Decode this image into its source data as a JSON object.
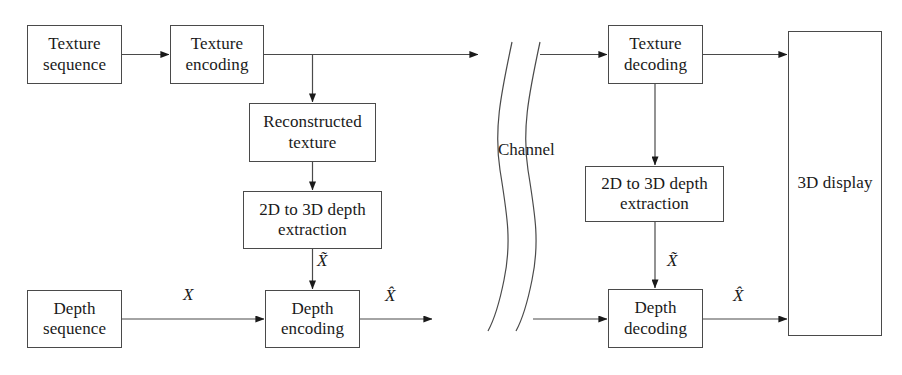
{
  "diagram": {
    "background_color": "#ffffff",
    "line_color": "#4a4a4a",
    "text_color": "#1a1a1a",
    "nodes": [
      {
        "id": "texture-sequence",
        "label": "Texture\nsequence",
        "x": 27,
        "y": 25,
        "w": 95,
        "h": 59
      },
      {
        "id": "texture-encoding",
        "label": "Texture\nencoding",
        "x": 170,
        "y": 25,
        "w": 94,
        "h": 59
      },
      {
        "id": "reconstructed-texture",
        "label": "Reconstructed\ntexture",
        "x": 249,
        "y": 103,
        "w": 127,
        "h": 59
      },
      {
        "id": "depth-extraction-left",
        "label": "2D to 3D depth\nextraction",
        "x": 243,
        "y": 191,
        "w": 139,
        "h": 58
      },
      {
        "id": "depth-sequence",
        "label": "Depth\nsequence",
        "x": 27,
        "y": 290,
        "w": 95,
        "h": 58
      },
      {
        "id": "depth-encoding",
        "label": "Depth\nencoding",
        "x": 265,
        "y": 290,
        "w": 95,
        "h": 58
      },
      {
        "id": "texture-decoding",
        "label": "Texture\ndecoding",
        "x": 608,
        "y": 25,
        "w": 95,
        "h": 59
      },
      {
        "id": "depth-extraction-right",
        "label": "2D to 3D depth\nextraction",
        "x": 585,
        "y": 166,
        "w": 139,
        "h": 56
      },
      {
        "id": "depth-decoding",
        "label": "Depth\ndecoding",
        "x": 608,
        "y": 289,
        "w": 95,
        "h": 59
      },
      {
        "id": "display-3d",
        "label": "3D display",
        "x": 788,
        "y": 31,
        "w": 94,
        "h": 305
      }
    ],
    "channel": {
      "label": "Channel",
      "label_x": 498,
      "label_y": 140
    },
    "edge_labels": [
      {
        "id": "x-plain-left",
        "text": "X",
        "x": 183,
        "y": 285
      },
      {
        "id": "x-tilde-left",
        "text": "X̃",
        "x": 317,
        "y": 251
      },
      {
        "id": "x-hat-left",
        "text": "X̂",
        "x": 385,
        "y": 286
      },
      {
        "id": "x-tilde-right",
        "text": "X̃",
        "x": 667,
        "y": 251
      },
      {
        "id": "x-hat-right",
        "text": "X̂",
        "x": 733,
        "y": 286
      }
    ],
    "connectors": [
      {
        "id": "texture-seq-to-enc",
        "from": "texture-sequence",
        "to": "texture-encoding"
      },
      {
        "id": "texture-enc-to-channel",
        "from": "texture-encoding",
        "to": "channel"
      },
      {
        "id": "texture-enc-to-recon",
        "from": "texture-encoding",
        "to": "reconstructed-texture"
      },
      {
        "id": "recon-to-extraction",
        "from": "reconstructed-texture",
        "to": "depth-extraction-left"
      },
      {
        "id": "extraction-to-depth-enc",
        "from": "depth-extraction-left",
        "to": "depth-encoding"
      },
      {
        "id": "depth-seq-to-depth-enc",
        "from": "depth-sequence",
        "to": "depth-encoding"
      },
      {
        "id": "depth-enc-to-channel",
        "from": "depth-encoding",
        "to": "channel"
      },
      {
        "id": "channel-to-texture-dec",
        "from": "channel",
        "to": "texture-decoding"
      },
      {
        "id": "channel-to-depth-dec",
        "from": "channel",
        "to": "depth-decoding"
      },
      {
        "id": "texture-dec-to-display",
        "from": "texture-decoding",
        "to": "display-3d"
      },
      {
        "id": "texture-dec-to-extraction",
        "from": "texture-decoding",
        "to": "depth-extraction-right"
      },
      {
        "id": "extraction-to-depth-dec",
        "from": "depth-extraction-right",
        "to": "depth-decoding"
      },
      {
        "id": "depth-dec-to-display",
        "from": "depth-decoding",
        "to": "display-3d"
      }
    ]
  }
}
